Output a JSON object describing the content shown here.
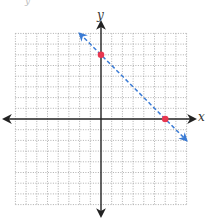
{
  "chart_data": {
    "type": "line",
    "title": "",
    "xlabel": "x",
    "ylabel": "y",
    "xlim": [
      -8,
      8
    ],
    "ylim": [
      -8,
      8
    ],
    "grid": true,
    "grid_style": "dotted",
    "series": [
      {
        "name": "y = -x + 6",
        "style": "dashed",
        "color": "#3a7bd5",
        "arrows": "both",
        "x": [
          -2,
          8
        ],
        "y": [
          8,
          -2
        ]
      }
    ],
    "points": [
      {
        "x": 0,
        "y": 6,
        "color": "#e8364f"
      },
      {
        "x": 6,
        "y": 0,
        "color": "#e8364f"
      }
    ]
  },
  "labels": {
    "x_axis": "x",
    "y_axis": "y",
    "corner": "y"
  },
  "colors": {
    "line": "#3a7bd5",
    "point": "#e8364f",
    "grid": "#9a9a9a",
    "axis": "#222222"
  }
}
